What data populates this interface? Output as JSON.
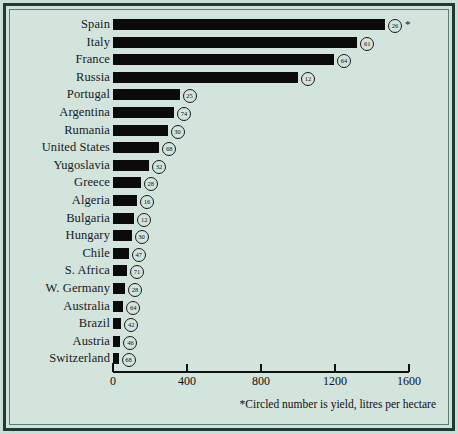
{
  "figure": {
    "background_color": "#d3e4dd",
    "frame_color": "#1d3b33",
    "bar_color": "#0b0b0b",
    "star_marker": "*",
    "footnote": "*Circled number is yield, litres per hectare"
  },
  "chart_data": {
    "type": "bar",
    "orientation": "horizontal",
    "title": "",
    "subtitle": "",
    "xlabel": "",
    "ylabel": "",
    "xlim": [
      0,
      1600
    ],
    "ylim": null,
    "grid": false,
    "legend": null,
    "xticks": [
      "0",
      "400",
      "800",
      "1200",
      "1600"
    ],
    "xtick_values": [
      0,
      400,
      800,
      1200,
      1600
    ],
    "annotation": "*Circled number is yield, litres per hectare",
    "value_unit": "thousands of hectolitres (production)",
    "label_unit": "litres per hectare (yield)",
    "categories": [
      "Spain",
      "Italy",
      "France",
      "Russia",
      "Portugal",
      "Argentina",
      "Rumania",
      "United States",
      "Yugoslavia",
      "Greece",
      "Algeria",
      "Bulgaria",
      "Hungary",
      "Chile",
      "S. Africa",
      "W. Germany",
      "Australia",
      "Brazil",
      "Austria",
      "Switzerland"
    ],
    "values": [
      1470,
      1320,
      1195,
      1000,
      360,
      330,
      295,
      250,
      195,
      150,
      130,
      115,
      100,
      85,
      75,
      65,
      55,
      45,
      40,
      30
    ],
    "yields": [
      26,
      61,
      64,
      12,
      25,
      74,
      30,
      68,
      32,
      28,
      16,
      12,
      30,
      47,
      71,
      28,
      64,
      42,
      46,
      68
    ],
    "starred": [
      true,
      false,
      false,
      false,
      false,
      false,
      false,
      false,
      false,
      false,
      false,
      false,
      false,
      false,
      false,
      false,
      false,
      false,
      false,
      false
    ]
  }
}
